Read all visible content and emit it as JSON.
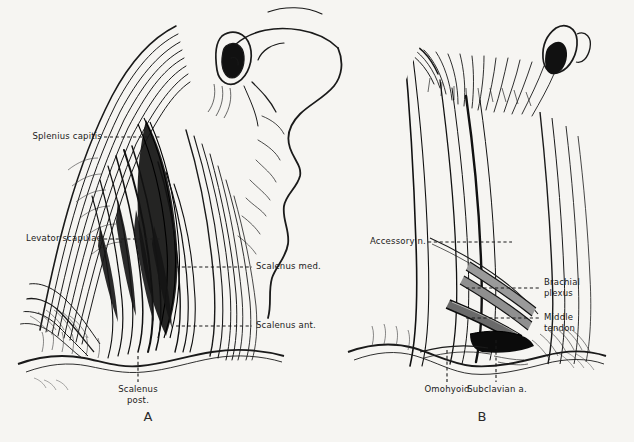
{
  "figure": {
    "background_color": "#f6f5f2",
    "ink_color": "#1a1a1a",
    "gray_tone": "#9a9a9a",
    "panels": [
      {
        "letter": "A",
        "name": "panel-a",
        "description": "Deep dissection showing splenius capitis, levator scapulae and scalene muscles"
      },
      {
        "letter": "B",
        "name": "panel-b",
        "description": "Dissection showing accessory nerve, brachial plexus, omohyoid and subclavian artery"
      }
    ]
  },
  "labels_a": [
    {
      "text": "Splenius capitis",
      "side": "left"
    },
    {
      "text": "Levator scapulae",
      "side": "left"
    },
    {
      "text": "Scalenus med.",
      "side": "right"
    },
    {
      "text": "Scalenus ant.",
      "side": "right"
    },
    {
      "text": "Scalenus",
      "text2": "post.",
      "side": "bottom"
    }
  ],
  "labels_b": [
    {
      "text": "Accessory n.",
      "side": "left"
    },
    {
      "text": "Brachial",
      "text2": "plexus",
      "side": "right"
    },
    {
      "text": "Middle",
      "text2": "tendon",
      "side": "right"
    },
    {
      "text": "Omohyoid",
      "side": "bottom"
    },
    {
      "text": "Subclavian a.",
      "side": "bottom"
    }
  ],
  "caption": ""
}
